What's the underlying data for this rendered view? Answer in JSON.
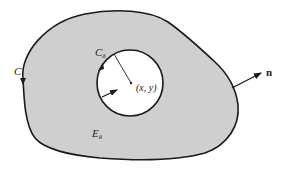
{
  "figure": {
    "colors": {
      "region_fill": "#cfcfcf",
      "stroke": "#1a1a1a",
      "hole_fill": "#ffffff",
      "background": "#ffffff"
    },
    "labels": {
      "outer_curve": "C",
      "inner_circle": "C",
      "inner_circle_sub": "δ",
      "point": "(x, y)",
      "region": "E",
      "region_sub": "δ",
      "normal": "n"
    }
  }
}
